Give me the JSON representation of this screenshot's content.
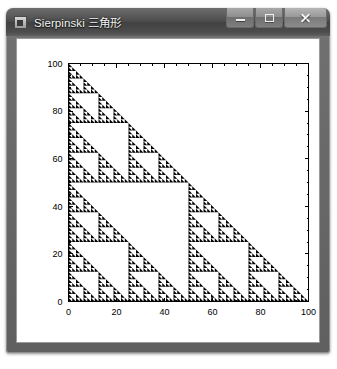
{
  "window": {
    "title": "Sierpinski 三角形",
    "icon": "app-icon",
    "buttons": {
      "minimize": "Minimize",
      "maximize": "Maximize",
      "close": "Close"
    }
  },
  "chart_data": {
    "type": "scatter",
    "title": "",
    "xlabel": "",
    "ylabel": "",
    "xlim": [
      0,
      100
    ],
    "ylim": [
      0,
      100
    ],
    "grid": false,
    "legend": null,
    "xticks": [
      0,
      20,
      40,
      60,
      80,
      100
    ],
    "yticks": [
      0,
      20,
      40,
      60,
      80,
      100
    ],
    "xticklabels": [
      "0",
      "20",
      "40",
      "60",
      "80",
      "100"
    ],
    "yticklabels": [
      "0",
      "20",
      "40",
      "60",
      "80",
      "100"
    ],
    "minor_tick_step": 5,
    "series": [
      {
        "name": "Sierpinski triangle",
        "color": "#000000",
        "shape": "right-triangle-fractal",
        "depth": 6,
        "vertices": [
          [
            0,
            0
          ],
          [
            100,
            0
          ],
          [
            0,
            100
          ]
        ]
      }
    ]
  }
}
